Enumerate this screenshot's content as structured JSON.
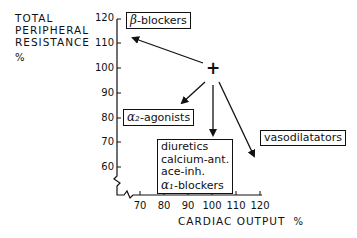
{
  "y_axis": {
    "label_lines": [
      "TOTAL",
      "PERIPHERAL",
      "RESISTANCE"
    ],
    "unit": "%",
    "ticks": [
      "120",
      "110",
      "100",
      "90",
      "80",
      "70",
      "60"
    ]
  },
  "x_axis": {
    "label": "CARDIAC OUTPUT",
    "unit": "%",
    "ticks": [
      "70",
      "80",
      "90",
      "100",
      "110",
      "120"
    ]
  },
  "origin_marker": "+",
  "origin_point": {
    "cardiac_output": 100,
    "resistance": 100
  },
  "boxes": {
    "beta": {
      "symbol": "β",
      "text": "-blockers"
    },
    "alpha2": {
      "symbol": "α₂",
      "text": "-agonists"
    },
    "group": {
      "lines": [
        "diuretics",
        "calcium-ant.",
        "ace-inh."
      ],
      "alpha1_symbol": "α₁",
      "alpha1_text": "-blockers"
    },
    "vaso": {
      "text": "vasodilatators"
    }
  }
}
